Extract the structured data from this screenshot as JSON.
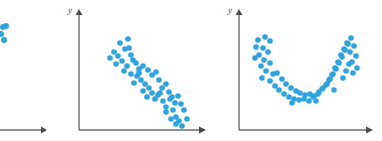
{
  "figure": {
    "background_color": "#ffffff",
    "dot_color": "#2ea3dc",
    "axis_color": "#6b6b6b",
    "width": 382,
    "height": 141
  },
  "panels": [
    {
      "id": "panel-left-partial",
      "name": "left-partial-scatterplot",
      "clipped": true,
      "axis_label_y": "",
      "axis_label_x": "",
      "note": "partially cropped at left image edge",
      "chart_data": {
        "type": "scatter",
        "title": "",
        "xlabel": "",
        "ylabel": "",
        "xlim": [
          0,
          47
        ],
        "ylim": [
          0,
          141
        ],
        "grid": false,
        "legend": "none",
        "points": [
          [
            3,
            27
          ],
          [
            6,
            26
          ],
          [
            1,
            34
          ],
          [
            4,
            40
          ]
        ],
        "axes": {
          "x_axis_y": 130,
          "x_axis_from": -10,
          "x_axis_to": 45,
          "y_axis_x": null
        }
      }
    },
    {
      "id": "panel-middle",
      "name": "negative-linear-scatterplot",
      "clipped": false,
      "axis_label_y": "y",
      "axis_label_x": "",
      "chart_data": {
        "type": "scatter",
        "title": "",
        "xlabel": "",
        "ylabel": "y",
        "xlim": [
          0,
          140
        ],
        "ylim": [
          0,
          141
        ],
        "grid": false,
        "legend": "none",
        "relationship": "negative linear",
        "axes": {
          "origin_x": 79,
          "origin_y": 130,
          "x_axis_to": 205,
          "y_axis_to": 10,
          "y_label_pos": [
            68,
            10
          ]
        },
        "points": [
          [
            114,
            52
          ],
          [
            120,
            43
          ],
          [
            125,
            49
          ],
          [
            110,
            58
          ],
          [
            118,
            56
          ],
          [
            128,
            39
          ],
          [
            131,
            55
          ],
          [
            122,
            61
          ],
          [
            116,
            64
          ],
          [
            133,
            60
          ],
          [
            127,
            66
          ],
          [
            136,
            63
          ],
          [
            124,
            71
          ],
          [
            139,
            69
          ],
          [
            131,
            74
          ],
          [
            143,
            66
          ],
          [
            137,
            76
          ],
          [
            148,
            70
          ],
          [
            141,
            80
          ],
          [
            134,
            83
          ],
          [
            152,
            75
          ],
          [
            145,
            84
          ],
          [
            156,
            72
          ],
          [
            149,
            88
          ],
          [
            143,
            91
          ],
          [
            159,
            80
          ],
          [
            152,
            93
          ],
          [
            147,
            97
          ],
          [
            162,
            88
          ],
          [
            155,
            99
          ],
          [
            166,
            84
          ],
          [
            158,
            95
          ],
          [
            169,
            92
          ],
          [
            163,
            101
          ],
          [
            172,
            97
          ],
          [
            166,
            107
          ],
          [
            175,
            103
          ],
          [
            170,
            99
          ],
          [
            178,
            96
          ],
          [
            173,
            110
          ],
          [
            181,
            104
          ],
          [
            176,
            117
          ],
          [
            184,
            110
          ],
          [
            179,
            121
          ],
          [
            171,
            119
          ],
          [
            187,
            119
          ],
          [
            182,
            126
          ],
          [
            176,
            124
          ],
          [
            166,
            112
          ],
          [
            160,
            93
          ],
          [
            139,
            73
          ],
          [
            129,
            48
          ]
        ]
      }
    },
    {
      "id": "panel-right",
      "name": "u-shaped-curvilinear-scatterplot",
      "clipped": false,
      "axis_label_y": "y",
      "axis_label_x": "",
      "chart_data": {
        "type": "scatter",
        "title": "",
        "xlabel": "",
        "ylabel": "y",
        "xlim": [
          0,
          162
        ],
        "ylim": [
          0,
          141
        ],
        "grid": false,
        "legend": "none",
        "relationship": "curvilinear (U-shaped)",
        "axes": {
          "origin_x": 239,
          "origin_y": 130,
          "x_axis_to": 372,
          "y_axis_to": 10,
          "y_label_pos": [
            228,
            10
          ]
        },
        "points": [
          [
            258,
            40
          ],
          [
            265,
            37
          ],
          [
            270,
            41
          ],
          [
            256,
            47
          ],
          [
            263,
            48
          ],
          [
            268,
            52
          ],
          [
            259,
            55
          ],
          [
            255,
            58
          ],
          [
            264,
            60
          ],
          [
            261,
            66
          ],
          [
            270,
            63
          ],
          [
            266,
            71
          ],
          [
            273,
            74
          ],
          [
            262,
            78
          ],
          [
            277,
            73
          ],
          [
            270,
            81
          ],
          [
            282,
            79
          ],
          [
            275,
            86
          ],
          [
            286,
            84
          ],
          [
            279,
            90
          ],
          [
            291,
            88
          ],
          [
            284,
            94
          ],
          [
            296,
            91
          ],
          [
            289,
            97
          ],
          [
            300,
            93
          ],
          [
            294,
            99
          ],
          [
            305,
            95
          ],
          [
            299,
            100
          ],
          [
            310,
            94
          ],
          [
            304,
            99
          ],
          [
            314,
            96
          ],
          [
            309,
            101
          ],
          [
            319,
            92
          ],
          [
            313,
            97
          ],
          [
            323,
            88
          ],
          [
            318,
            94
          ],
          [
            327,
            84
          ],
          [
            322,
            89
          ],
          [
            330,
            79
          ],
          [
            326,
            85
          ],
          [
            333,
            74
          ],
          [
            329,
            80
          ],
          [
            336,
            69
          ],
          [
            332,
            75
          ],
          [
            339,
            63
          ],
          [
            335,
            68
          ],
          [
            342,
            57
          ],
          [
            338,
            62
          ],
          [
            345,
            50
          ],
          [
            341,
            55
          ],
          [
            348,
            44
          ],
          [
            344,
            49
          ],
          [
            351,
            38
          ],
          [
            347,
            43
          ],
          [
            354,
            46
          ],
          [
            350,
            52
          ],
          [
            356,
            56
          ],
          [
            352,
            62
          ],
          [
            357,
            68
          ],
          [
            353,
            73
          ],
          [
            346,
            71
          ],
          [
            349,
            64
          ],
          [
            343,
            78
          ],
          [
            334,
            90
          ],
          [
            316,
            101
          ],
          [
            292,
            103
          ]
        ]
      }
    }
  ]
}
